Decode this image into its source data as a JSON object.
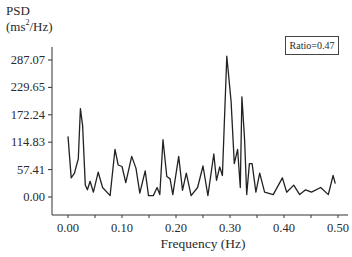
{
  "chart_data": {
    "type": "line",
    "title": "",
    "ylabel": "PSD (ms²/Hz)",
    "ylabel_line1": "PSD",
    "ylabel_line2_prefix": "(ms",
    "ylabel_line2_sup": "2",
    "ylabel_line2_suffix": "/Hz)",
    "xlabel": "Frequency (Hz)",
    "annotation": "Ratio=0.47",
    "xlim": [
      0.0,
      0.5
    ],
    "ylim": [
      0.0,
      287.07
    ],
    "grid": false,
    "legend": null,
    "y_ticks": [
      "287.07",
      "229.65",
      "172.24",
      "114.83",
      "57.41",
      "0.00"
    ],
    "y_tick_values": [
      287.07,
      229.65,
      172.24,
      114.83,
      57.41,
      0.0
    ],
    "x_ticks": [
      "0.00",
      "0.10",
      "0.20",
      "0.30",
      "0.40",
      "0.50"
    ],
    "x_tick_values": [
      0.0,
      0.1,
      0.2,
      0.3,
      0.4,
      0.5
    ],
    "series": [
      {
        "name": "PSD",
        "color": "#222222",
        "x": [
          0.0,
          0.006,
          0.012,
          0.016,
          0.019,
          0.023,
          0.027,
          0.032,
          0.036,
          0.041,
          0.047,
          0.056,
          0.064,
          0.078,
          0.087,
          0.093,
          0.1,
          0.107,
          0.118,
          0.126,
          0.133,
          0.143,
          0.149,
          0.158,
          0.165,
          0.17,
          0.176,
          0.183,
          0.189,
          0.194,
          0.205,
          0.212,
          0.219,
          0.228,
          0.24,
          0.25,
          0.259,
          0.27,
          0.275,
          0.281,
          0.286,
          0.294,
          0.302,
          0.308,
          0.314,
          0.319,
          0.322,
          0.327,
          0.331,
          0.336,
          0.341,
          0.348,
          0.355,
          0.364,
          0.38,
          0.397,
          0.405,
          0.418,
          0.429,
          0.44,
          0.451,
          0.468,
          0.482,
          0.491,
          0.495
        ],
        "values": [
          127,
          40,
          50,
          67,
          80,
          185,
          150,
          25,
          15,
          33,
          10,
          52,
          20,
          3,
          100,
          67,
          64,
          30,
          85,
          60,
          8,
          55,
          3,
          3,
          20,
          5,
          120,
          43,
          38,
          5,
          85,
          14,
          50,
          3,
          20,
          65,
          3,
          90,
          35,
          63,
          45,
          295,
          200,
          70,
          100,
          20,
          210,
          120,
          5,
          70,
          70,
          10,
          50,
          10,
          5,
          40,
          10,
          25,
          5,
          15,
          10,
          20,
          5,
          45,
          28
        ]
      }
    ]
  }
}
